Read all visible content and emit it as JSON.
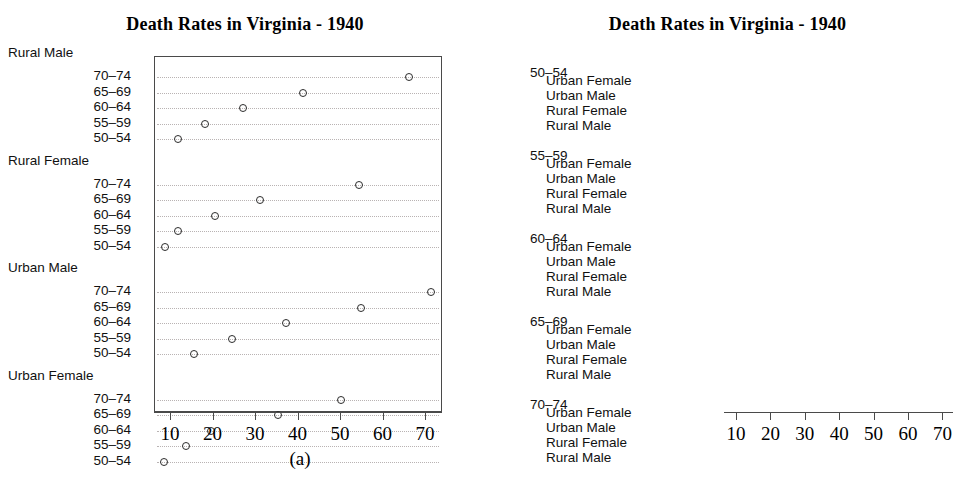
{
  "panel_a": {
    "title": "Death Rates in Virginia - 1940",
    "caption": "(a)",
    "axis_ticks": [
      "10",
      "20",
      "30",
      "40",
      "50",
      "60",
      "70"
    ],
    "groups": [
      {
        "head": "Rural Male",
        "rows": [
          "70–74",
          "65–69",
          "60–64",
          "55–59",
          "50–54"
        ]
      },
      {
        "head": "Rural Female",
        "rows": [
          "70–74",
          "65–69",
          "60–64",
          "55–59",
          "50–54"
        ]
      },
      {
        "head": "Urban Male",
        "rows": [
          "70–74",
          "65–69",
          "60–64",
          "55–59",
          "50–54"
        ]
      },
      {
        "head": "Urban Female",
        "rows": [
          "70–74",
          "65–69",
          "60–64",
          "55–59",
          "50–54"
        ]
      }
    ]
  },
  "panel_b": {
    "title": "Death Rates in Virginia - 1940",
    "caption": "(b)",
    "axis_ticks": [
      "10",
      "20",
      "30",
      "40",
      "50",
      "60",
      "70"
    ],
    "groups": [
      {
        "head": "50–54",
        "rows": [
          "Urban Female",
          "Urban Male",
          "Rural Female",
          "Rural Male"
        ]
      },
      {
        "head": "55–59",
        "rows": [
          "Urban Female",
          "Urban Male",
          "Rural Female",
          "Rural Male"
        ]
      },
      {
        "head": "60–64",
        "rows": [
          "Urban Female",
          "Urban Male",
          "Rural Female",
          "Rural Male"
        ]
      },
      {
        "head": "65–69",
        "rows": [
          "Urban Female",
          "Urban Male",
          "Rural Female",
          "Rural Male"
        ]
      },
      {
        "head": "70–74",
        "rows": [
          "Urban Female",
          "Urban Male",
          "Rural Female",
          "Rural Male"
        ]
      }
    ]
  },
  "chart_data": [
    {
      "id": "a",
      "type": "scatter",
      "title": "Death Rates in Virginia - 1940",
      "caption": "(a)",
      "xlabel": "",
      "ylabel": "",
      "xlim": [
        6,
        74
      ],
      "xticks": [
        10,
        20,
        30,
        40,
        50,
        60,
        70
      ],
      "grid": true,
      "legend": "none",
      "grouping": "by population group, then age band",
      "groups": [
        {
          "name": "Rural Male",
          "categories": [
            "70–74",
            "65–69",
            "60–64",
            "55–59",
            "50–54"
          ],
          "values": [
            66.0,
            41.0,
            26.9,
            18.1,
            11.7
          ]
        },
        {
          "name": "Rural Female",
          "categories": [
            "70–74",
            "65–69",
            "60–64",
            "55–59",
            "50–54"
          ],
          "values": [
            54.3,
            30.9,
            20.3,
            11.7,
            8.7
          ]
        },
        {
          "name": "Urban Male",
          "categories": [
            "70–74",
            "65–69",
            "60–64",
            "55–59",
            "50–54"
          ],
          "values": [
            71.1,
            54.6,
            37.0,
            24.3,
            15.4
          ]
        },
        {
          "name": "Urban Female",
          "categories": [
            "70–74",
            "65–69",
            "60–64",
            "55–59",
            "50–54"
          ],
          "values": [
            50.0,
            35.1,
            19.3,
            13.6,
            8.4
          ]
        }
      ]
    },
    {
      "id": "b",
      "type": "scatter",
      "title": "Death Rates in Virginia - 1940",
      "caption": "(b)",
      "xlabel": "",
      "ylabel": "",
      "xlim": [
        6,
        74
      ],
      "xticks": [
        10,
        20,
        30,
        40,
        50,
        60,
        70
      ],
      "grid": true,
      "legend": "none",
      "grouping": "by age band, then population group",
      "groups": [
        {
          "name": "50–54",
          "categories": [
            "Urban Female",
            "Urban Male",
            "Rural Female",
            "Rural Male"
          ],
          "values": [
            8.4,
            15.4,
            8.7,
            11.7
          ]
        },
        {
          "name": "55–59",
          "categories": [
            "Urban Female",
            "Urban Male",
            "Rural Female",
            "Rural Male"
          ],
          "values": [
            13.6,
            24.3,
            11.7,
            18.1
          ]
        },
        {
          "name": "60–64",
          "categories": [
            "Urban Female",
            "Urban Male",
            "Rural Female",
            "Rural Male"
          ],
          "values": [
            19.3,
            37.0,
            20.3,
            26.9
          ]
        },
        {
          "name": "65–69",
          "categories": [
            "Urban Female",
            "Urban Male",
            "Rural Female",
            "Rural Male"
          ],
          "values": [
            35.1,
            54.6,
            30.9,
            41.0
          ]
        },
        {
          "name": "70–74",
          "categories": [
            "Urban Female",
            "Urban Male",
            "Rural Female",
            "Rural Male"
          ],
          "values": [
            50.0,
            71.1,
            54.3,
            66.0
          ]
        }
      ]
    }
  ]
}
